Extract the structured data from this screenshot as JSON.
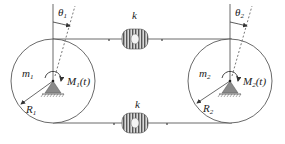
{
  "diagram": {
    "disk_left": {
      "mass_label": "m",
      "mass_sub": "1",
      "radius_label": "R",
      "radius_sub": "1",
      "moment_label": "M",
      "moment_sub": "1",
      "moment_arg": "(t)",
      "angle_label": "θ",
      "angle_sub": "1"
    },
    "disk_right": {
      "mass_label": "m",
      "mass_sub": "2",
      "radius_label": "R",
      "radius_sub": "2",
      "moment_label": "M",
      "moment_sub": "2",
      "moment_arg": "(t)",
      "angle_label": "θ",
      "angle_sub": "2"
    },
    "spring_top": {
      "label": "k"
    },
    "spring_bottom": {
      "label": "k"
    },
    "colors": {
      "line": "#444444",
      "support": "#8a8a8a",
      "spring": "#777777"
    }
  }
}
